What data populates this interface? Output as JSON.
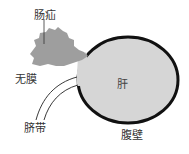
{
  "diagram": {
    "labels": {
      "hernia": "肠疝",
      "membraneless": "无膜",
      "umbilical_cord": "脐带",
      "liver": "肝",
      "abdominal_wall": "腹壁"
    },
    "colors": {
      "hernia_fill": "#9e9e9e",
      "liver_fill": "#d6d6d6",
      "wall_stroke": "#111111",
      "cord_stroke": "#222222",
      "text": "#333333",
      "background": "#ffffff"
    }
  }
}
